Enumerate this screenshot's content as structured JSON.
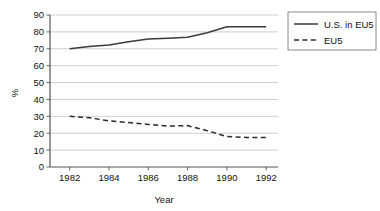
{
  "chart_data": {
    "type": "line",
    "title": "",
    "xlabel": "Year",
    "ylabel": "%",
    "x": [
      1982,
      1983,
      1984,
      1985,
      1986,
      1987,
      1988,
      1989,
      1990,
      1991,
      1992
    ],
    "xticks": [
      "1982",
      "1984",
      "1986",
      "1988",
      "1990",
      "1992"
    ],
    "xtick_values": [
      1982,
      1984,
      1986,
      1988,
      1990,
      1992
    ],
    "yticks": [
      "0",
      "10",
      "20",
      "30",
      "40",
      "50",
      "60",
      "70",
      "80",
      "90"
    ],
    "ytick_values": [
      0,
      10,
      20,
      30,
      40,
      50,
      60,
      70,
      80,
      90
    ],
    "xlim": [
      1981,
      1992.6
    ],
    "ylim": [
      0,
      90
    ],
    "grid": "horizontal",
    "legend_position": "right",
    "series": [
      {
        "name": "U.S. in EU5",
        "style": "solid",
        "color": "#3a3a3a",
        "values": [
          70,
          71.3,
          72.3,
          74.2,
          75.8,
          76.3,
          76.8,
          79.5,
          83,
          83,
          83
        ]
      },
      {
        "name": "EU5",
        "style": "dashed",
        "color": "#2b2b2b",
        "values": [
          30,
          29.2,
          27.3,
          26.3,
          25.2,
          24.2,
          24.5,
          21.5,
          18,
          17.5,
          17.5
        ]
      }
    ]
  },
  "legend": {
    "entries": [
      {
        "label": "U.S. in EU5"
      },
      {
        "label": "EU5"
      }
    ]
  }
}
